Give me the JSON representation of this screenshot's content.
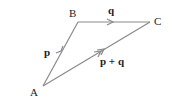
{
  "diagram": {
    "stroke_color": "#8a8a8a",
    "vertices": [
      {
        "label": "A",
        "x": 43,
        "y": 86
      },
      {
        "label": "B",
        "x": 78,
        "y": 22
      },
      {
        "label": "C",
        "x": 150,
        "y": 22
      }
    ],
    "edges": [
      {
        "from": "A",
        "to": "B",
        "label": "p"
      },
      {
        "from": "B",
        "to": "C",
        "label": "q"
      },
      {
        "from": "A",
        "to": "C",
        "label": "p + q"
      }
    ],
    "labels": {
      "A": "A",
      "B": "B",
      "C": "C",
      "p": "p",
      "q": "q",
      "pq": "p + q"
    }
  }
}
